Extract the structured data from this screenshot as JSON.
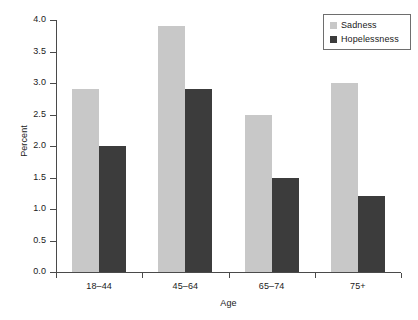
{
  "chart_data": {
    "type": "bar",
    "title": "",
    "xlabel": "Age",
    "ylabel": "Percent",
    "categories": [
      "18–44",
      "45–64",
      "65–74",
      "75+"
    ],
    "series": [
      {
        "name": "Sadness",
        "color": "#c8c8c8",
        "values": [
          2.9,
          3.9,
          2.5,
          3.0
        ]
      },
      {
        "name": "Hopelessness",
        "color": "#3c3c3c",
        "values": [
          2.0,
          2.9,
          1.5,
          1.2
        ]
      }
    ],
    "ylim": [
      0.0,
      4.0
    ],
    "ytick_labels": [
      "0.0",
      "0.5",
      "1.0",
      "1.5",
      "2.0",
      "2.5",
      "3.0",
      "3.5",
      "4.0"
    ],
    "ytick_values": [
      0.0,
      0.5,
      1.0,
      1.5,
      2.0,
      2.5,
      3.0,
      3.5,
      4.0
    ],
    "grid": false,
    "legend_position": "top-right"
  },
  "legend": {
    "entries": [
      {
        "label": "Sadness",
        "color": "#c8c8c8"
      },
      {
        "label": "Hopelessness",
        "color": "#3c3c3c"
      }
    ]
  },
  "axes": {
    "y_title": "Percent",
    "x_title": "Age"
  }
}
